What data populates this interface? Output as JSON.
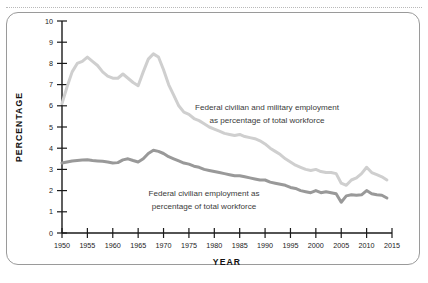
{
  "figure": {
    "frame_border_color": "#9a9a9a",
    "top_rule_color": "#b9b9b9",
    "background": "#ffffff"
  },
  "chart_data": {
    "type": "line",
    "title": "",
    "xlabel": "YEAR",
    "ylabel": "PERCENTAGE",
    "xlim": [
      1950,
      2015
    ],
    "ylim": [
      0,
      10
    ],
    "grid": false,
    "legend": "inline-annotations",
    "xticks": [
      1950,
      1955,
      1960,
      1965,
      1970,
      1975,
      1980,
      1985,
      1990,
      1995,
      2000,
      2005,
      2010,
      2015
    ],
    "xtick_labels": [
      "1950",
      "1955",
      "1960",
      "1965",
      "1970",
      "1975",
      "1980",
      "1985",
      "1990",
      "1995",
      "2000",
      "2005",
      "2010",
      "2015"
    ],
    "yticks": [
      0,
      1,
      2,
      3,
      4,
      5,
      6,
      7,
      8,
      9,
      10
    ],
    "ytick_labels": [
      "0",
      "1",
      "2",
      "3",
      "4",
      "5",
      "6",
      "7",
      "8",
      "9",
      "10"
    ],
    "x": [
      1950,
      1951,
      1952,
      1953,
      1954,
      1955,
      1956,
      1957,
      1958,
      1959,
      1960,
      1961,
      1962,
      1963,
      1964,
      1965,
      1966,
      1967,
      1968,
      1969,
      1970,
      1971,
      1972,
      1973,
      1974,
      1975,
      1976,
      1977,
      1978,
      1979,
      1980,
      1981,
      1982,
      1983,
      1984,
      1985,
      1986,
      1987,
      1988,
      1989,
      1990,
      1991,
      1992,
      1993,
      1994,
      1995,
      1996,
      1997,
      1998,
      1999,
      2000,
      2001,
      2002,
      2003,
      2004,
      2005,
      2006,
      2007,
      2008,
      2009,
      2010,
      2011,
      2012,
      2013,
      2014
    ],
    "series": [
      {
        "name": "Federal civilian and military employment as percentage of total workforce",
        "color": "#cfcfcf",
        "linewidth": 3.0,
        "values": [
          6.1,
          6.9,
          7.6,
          8.0,
          8.1,
          8.3,
          8.1,
          7.9,
          7.6,
          7.4,
          7.3,
          7.3,
          7.5,
          7.3,
          7.1,
          6.95,
          7.6,
          8.2,
          8.45,
          8.3,
          7.7,
          7.0,
          6.5,
          6.0,
          5.7,
          5.6,
          5.4,
          5.3,
          5.15,
          5.0,
          4.9,
          4.8,
          4.7,
          4.65,
          4.6,
          4.65,
          4.55,
          4.5,
          4.45,
          4.35,
          4.2,
          4.0,
          3.85,
          3.7,
          3.5,
          3.35,
          3.2,
          3.1,
          3.0,
          2.95,
          3.0,
          2.9,
          2.85,
          2.85,
          2.8,
          2.35,
          2.25,
          2.5,
          2.6,
          2.8,
          3.1,
          2.85,
          2.75,
          2.65,
          2.5
        ]
      },
      {
        "name": "Federal civilian employment as percentage of total workforce",
        "color": "#999999",
        "linewidth": 3.0,
        "values": [
          3.3,
          3.35,
          3.4,
          3.42,
          3.44,
          3.45,
          3.42,
          3.4,
          3.38,
          3.35,
          3.3,
          3.32,
          3.45,
          3.5,
          3.42,
          3.35,
          3.5,
          3.75,
          3.9,
          3.85,
          3.75,
          3.6,
          3.5,
          3.4,
          3.3,
          3.25,
          3.15,
          3.1,
          3.0,
          2.95,
          2.9,
          2.85,
          2.8,
          2.75,
          2.7,
          2.7,
          2.65,
          2.6,
          2.55,
          2.5,
          2.5,
          2.4,
          2.35,
          2.3,
          2.25,
          2.15,
          2.1,
          2.0,
          1.95,
          1.9,
          2.0,
          1.9,
          1.95,
          1.9,
          1.85,
          1.45,
          1.75,
          1.8,
          1.78,
          1.8,
          2.0,
          1.85,
          1.8,
          1.78,
          1.65
        ]
      }
    ],
    "annotations": [
      {
        "id": "upper-series-annotation",
        "lines": [
          "Federal civilian and military employment",
          "as percentage of total workforce"
        ]
      },
      {
        "id": "lower-series-annotation",
        "lines": [
          "Federal civilian employment as",
          "percentage of total workforce"
        ]
      }
    ]
  }
}
